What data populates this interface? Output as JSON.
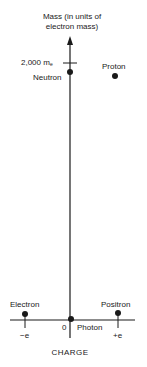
{
  "diagram": {
    "y_axis_label_line1": "Mass (in units of",
    "y_axis_label_line2": "electron mass)",
    "tick_label": "2,000 m",
    "tick_label_subscript": "e",
    "x_axis_label": "CHARGE",
    "origin_label": "0",
    "x_tick_neg": "−e",
    "x_tick_pos": "+e",
    "particles": [
      {
        "name": "Neutron",
        "charge": "0",
        "mass_me": 1839
      },
      {
        "name": "Proton",
        "charge": "+e",
        "mass_me": 1836
      },
      {
        "name": "Electron",
        "charge": "-e",
        "mass_me": 1
      },
      {
        "name": "Positron",
        "charge": "+e",
        "mass_me": 1
      },
      {
        "name": "Photon",
        "charge": "0",
        "mass_me": 0
      }
    ],
    "ink_color": "#1a1a1a"
  }
}
